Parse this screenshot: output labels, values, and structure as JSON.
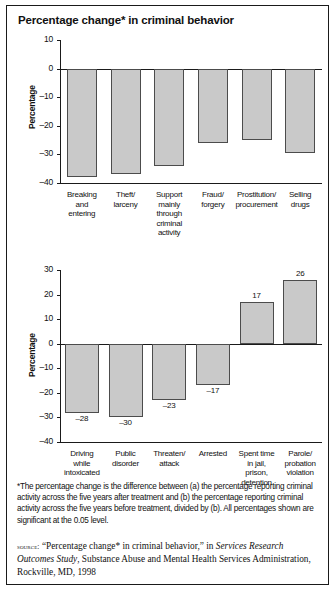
{
  "figure": {
    "title": "Percentage change* in criminal behavior",
    "footnote": "*The percentage change is the difference between (a) the percentage reporting criminal activity across the five years after treatment and (b) the percentage reporting criminal activity across the five years before treatment, divided by (b). All percentages shown are significant at the 0.05 level.",
    "source_prefix": "source:",
    "source_text_1": "“Percentage change* in criminal behavior,” in ",
    "source_italic": "Services Research Outcomes Study",
    "source_text_2": ", Substance Abuse and Mental Health Services Administration, Rockville, MD, 1998",
    "bar_fill": "#c9c9c9",
    "bar_stroke": "#4c4c4c",
    "axis_color": "#1a1a1a"
  },
  "chart_data": [
    {
      "type": "bar",
      "title": "Percentage change* in criminal behavior",
      "xlabel": "",
      "ylabel": "Percentage",
      "ylim": [
        -40,
        10
      ],
      "yticks": [
        10,
        0,
        -10,
        -20,
        -30,
        -40
      ],
      "ytick_labels": [
        "10",
        "0",
        "–10",
        "–20",
        "–30",
        "–40"
      ],
      "grid": false,
      "legend": "none",
      "categories": [
        "Breaking and entering",
        "Theft/ larceny",
        "Support mainly through criminal activity",
        "Fraud/ forgery",
        "Prostitution/ procurement",
        "Selling drugs"
      ],
      "category_lines": [
        [
          "Breaking",
          "and",
          "entering"
        ],
        [
          "Theft/",
          "larceny"
        ],
        [
          "Support",
          "mainly",
          "through",
          "criminal",
          "activity"
        ],
        [
          "Fraud/",
          "forgery"
        ],
        [
          "Prostitution/",
          "procurement"
        ],
        [
          "Selling",
          "drugs"
        ]
      ],
      "values": [
        -38,
        -37,
        -34,
        -26,
        -25,
        -29.5
      ],
      "value_labels": [
        "",
        "",
        "",
        "",
        "",
        ""
      ]
    },
    {
      "type": "bar",
      "title": "",
      "xlabel": "",
      "ylabel": "Percentage",
      "ylim": [
        -40,
        30
      ],
      "yticks": [
        30,
        20,
        10,
        0,
        -10,
        -20,
        -30,
        -40
      ],
      "ytick_labels": [
        "30",
        "20",
        "10",
        "0",
        "–10",
        "–20",
        "–30",
        "–40"
      ],
      "grid": false,
      "legend": "none",
      "categories": [
        "Driving while intoxicated",
        "Public disorder",
        "Threaten/ attack",
        "Arrested",
        "Spent time in jail, prison, detention",
        "Parole/ probation violation"
      ],
      "category_lines": [
        [
          "Driving",
          "while",
          "intoxicated"
        ],
        [
          "Public",
          "disorder"
        ],
        [
          "Threaten/",
          "attack"
        ],
        [
          "Arrested"
        ],
        [
          "Spent time",
          "in jail,",
          "prison,",
          "detention"
        ],
        [
          "Parole/",
          "probation",
          "violation"
        ]
      ],
      "values": [
        -28,
        -30,
        -23,
        -17,
        17,
        26
      ],
      "value_labels": [
        "–28",
        "–30",
        "–23",
        "–17",
        "17",
        "26"
      ]
    }
  ]
}
